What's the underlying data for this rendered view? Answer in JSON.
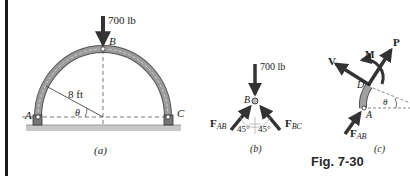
{
  "figure": {
    "caption": "Fig. 7-30",
    "panel_a": {
      "label": "(a)",
      "load": "700 lb",
      "point_b": "B",
      "point_a": "A",
      "point_c": "C",
      "radius": "8 ft",
      "angle": "θ"
    },
    "panel_b": {
      "label": "(b)",
      "load": "700 lb",
      "point_b": "B",
      "force_ab": "F",
      "force_ab_sub": "AB",
      "force_bc": "F",
      "force_bc_sub": "BC",
      "angle_left": "45°",
      "angle_right": "45°"
    },
    "panel_c": {
      "label": "(c)",
      "shear": "V",
      "moment": "M",
      "normal": "P",
      "point_d": "D",
      "point_a": "A",
      "angle": "θ",
      "force_ab": "F",
      "force_ab_sub": "AB"
    },
    "colors": {
      "arch": "#7a7a7a",
      "arrow": "#333333",
      "ground": "#bdbdbd",
      "dashed": "#555555"
    }
  }
}
